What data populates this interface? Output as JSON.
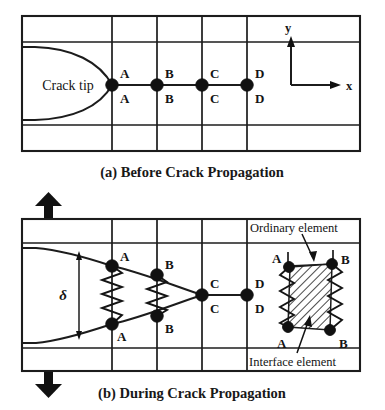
{
  "figure": {
    "type": "engineering-diagram",
    "title_visible": false,
    "background": "#ffffff",
    "ink_color": "#1a1a1a",
    "panels": [
      {
        "id": "a",
        "caption": "(a) Before Crack Propagation",
        "crack_tip_label": "Crack tip",
        "axes": {
          "x_label": "x",
          "y_label": "y"
        },
        "node_pairs": [
          {
            "label_upper": "A",
            "label_lower": "A"
          },
          {
            "label_upper": "B",
            "label_lower": "B"
          },
          {
            "label_upper": "C",
            "label_lower": "C"
          },
          {
            "label_upper": "D",
            "label_lower": "D"
          }
        ]
      },
      {
        "id": "b",
        "caption": "(b) During Crack Propagation",
        "opening_symbol": "δ",
        "node_pairs": [
          {
            "label_upper": "A",
            "label_lower": "A"
          },
          {
            "label_upper": "B",
            "label_lower": "B"
          },
          {
            "label_upper": "C",
            "label_lower": "C"
          },
          {
            "label_upper": "D",
            "label_lower": "D"
          }
        ],
        "inset": {
          "ordinary_element_label": "Ordinary element",
          "interface_element_label": "Interface element",
          "corner_labels": {
            "top_left": "A",
            "top_right": "B",
            "bottom_left": "A",
            "bottom_right": "B"
          }
        }
      }
    ]
  },
  "geometry": {
    "panel_a": {
      "frame": {
        "x": 22,
        "y": 16,
        "w": 338,
        "h": 135
      },
      "inner_top_y": 42,
      "inner_bottom_y": 125,
      "grid_x": [
        112,
        157,
        202,
        247
      ],
      "node_y": 85,
      "notch_left_x": 27,
      "right_block_x": 247
    },
    "panel_b": {
      "frame": {
        "x": 22,
        "y": 219,
        "w": 338,
        "h": 152
      },
      "inner_top_y": 243,
      "inner_bottom_y": 348,
      "grid_x": [
        112,
        157,
        202,
        247
      ],
      "mid_y": 295,
      "a_upper_y": 266,
      "a_lower_y": 324,
      "b_upper_y": 275,
      "b_lower_y": 316,
      "c_y": 295,
      "d_y": 295
    }
  }
}
